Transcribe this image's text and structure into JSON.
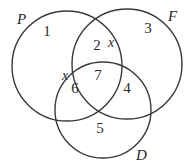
{
  "diagram": {
    "type": "venn",
    "stroke_color": "#3a3a3a",
    "sets": [
      {
        "name": "P",
        "cx": 67,
        "cy": 66,
        "r": 55,
        "label_x": 17,
        "label_y": 24
      },
      {
        "name": "F",
        "cx": 127,
        "cy": 64,
        "r": 55,
        "label_x": 168,
        "label_y": 21
      },
      {
        "name": "D",
        "cx": 103,
        "cy": 110,
        "r": 48,
        "label_x": 136,
        "label_y": 160
      }
    ],
    "regions": [
      {
        "id": "P_only",
        "value": "1",
        "x": 47,
        "y": 36
      },
      {
        "id": "P_F",
        "value": "2",
        "x": 97,
        "y": 50
      },
      {
        "id": "F_only",
        "value": "3",
        "x": 148,
        "y": 33
      },
      {
        "id": "F_D",
        "value": "4",
        "x": 127,
        "y": 93
      },
      {
        "id": "D_only",
        "value": "5",
        "x": 100,
        "y": 133
      },
      {
        "id": "P_D",
        "value": "6",
        "x": 75,
        "y": 93
      },
      {
        "id": "P_F_D",
        "value": "7",
        "x": 98,
        "y": 80
      }
    ],
    "annotations": [
      {
        "text": "x",
        "x": 108,
        "y": 47
      },
      {
        "text": "x",
        "x": 62,
        "y": 80
      }
    ]
  }
}
